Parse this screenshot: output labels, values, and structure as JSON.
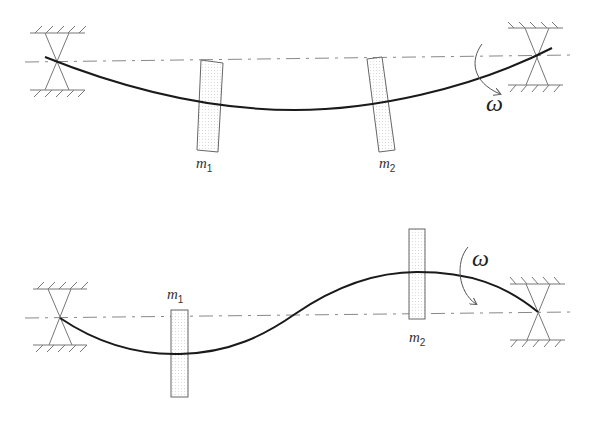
{
  "diagrams": [
    {
      "id": "first-mode",
      "labels": {
        "mass1": "m",
        "mass1_sub": "1",
        "mass2": "m",
        "mass2_sub": "2",
        "omega": "ω"
      }
    },
    {
      "id": "second-mode",
      "labels": {
        "mass1": "m",
        "mass1_sub": "1",
        "mass2": "m",
        "mass2_sub": "2",
        "omega": "ω"
      }
    }
  ],
  "colors": {
    "shaft": "#1a1a1a",
    "axis": "#888888",
    "support": "#777777",
    "disk_fill": "#f2f2f2",
    "disk_stroke": "#666666"
  }
}
